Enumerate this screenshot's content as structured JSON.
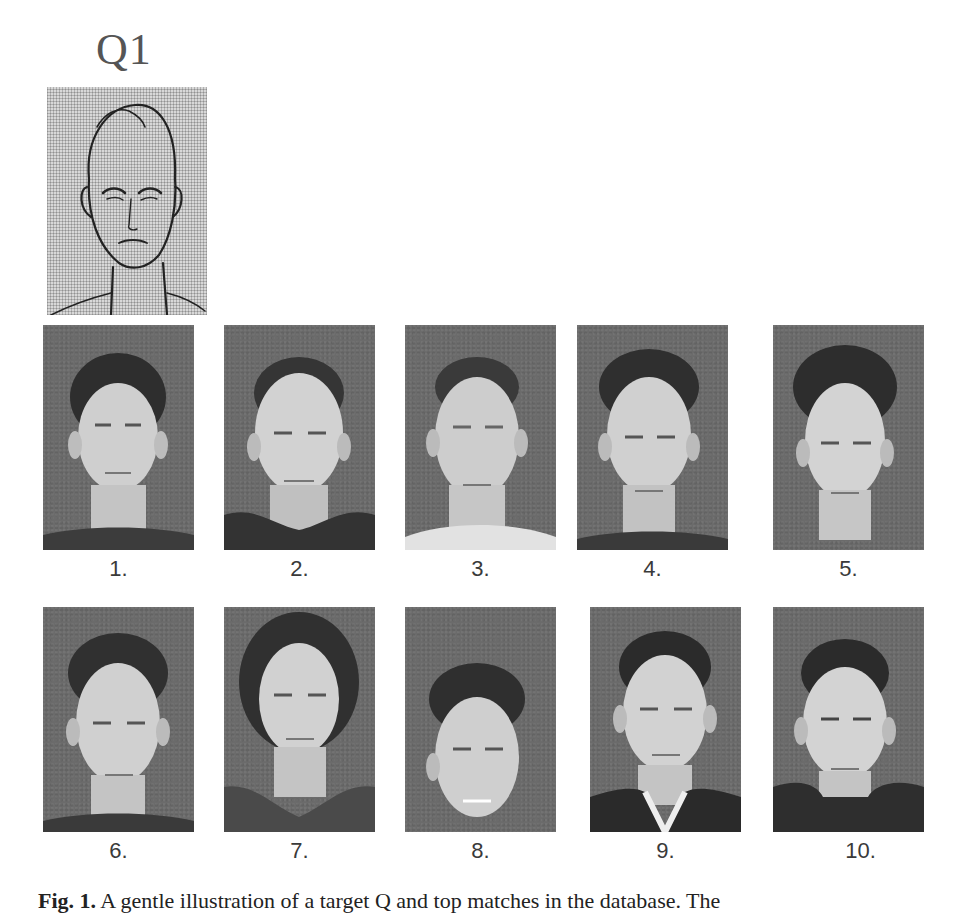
{
  "figure": {
    "query_label": "Q1",
    "query_image": {
      "type": "sketch",
      "description": "forensic sketch of male face"
    },
    "results": [
      {
        "rank": "1.",
        "description": "photo of young man, dark hair, dark shirt"
      },
      {
        "rank": "2.",
        "description": "photo of man, receding hairline, dark jacket"
      },
      {
        "rank": "3.",
        "description": "photo of man, short hair, light shirt"
      },
      {
        "rank": "4.",
        "description": "photo of man, curly dark hair, dark collar"
      },
      {
        "rank": "5.",
        "description": "photo of man, voluminous dark hair"
      },
      {
        "rank": "6.",
        "description": "photo of man, wavy hair, slight smile"
      },
      {
        "rank": "7.",
        "description": "photo of man, long hair, v-neck shirt"
      },
      {
        "rank": "8.",
        "description": "photo of man, tousled hair, smiling"
      },
      {
        "rank": "9.",
        "description": "photo of man, short hair, white collar"
      },
      {
        "rank": "10.",
        "description": "photo of man, dark hair, dark hoodie"
      }
    ],
    "caption_partial": {
      "prefix": "Fig. 1.",
      "text": "A gentle illustration of a target Q and top matches in the database. The"
    }
  },
  "colors": {
    "photo_background": "#6b6b6b",
    "sketch_background": "#d8d8d8",
    "label_text": "#3a3a3a"
  }
}
